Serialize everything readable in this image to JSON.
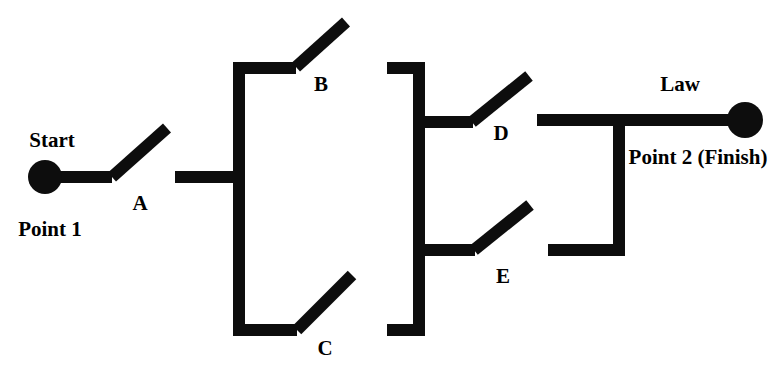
{
  "diagram": {
    "type": "circuit-switch-diagram",
    "width": 782,
    "height": 371,
    "colors": {
      "wire": "#0d0d0d",
      "background": "#ffffff",
      "text": "#000000"
    },
    "stroke_width": 12,
    "terminals": [
      {
        "id": "point1",
        "name": "start-terminal",
        "cx": 45,
        "cy": 177,
        "r": 17,
        "title": "Start",
        "subtitle": "Point 1"
      },
      {
        "id": "point2",
        "name": "finish-terminal",
        "cx": 745,
        "cy": 120,
        "r": 18,
        "title": "Law",
        "subtitle": "Point 2 (Finish)"
      }
    ],
    "switches": [
      {
        "id": "A",
        "label": "A",
        "label_x": 140,
        "label_y": 203,
        "pivot_x": 112,
        "pivot_y": 177,
        "tip_x": 167,
        "tip_y": 128,
        "state": "open"
      },
      {
        "id": "B",
        "label": "B",
        "label_x": 321,
        "label_y": 84,
        "pivot_x": 296,
        "pivot_y": 67,
        "tip_x": 346,
        "tip_y": 22,
        "state": "open"
      },
      {
        "id": "C",
        "label": "C",
        "label_x": 325,
        "label_y": 348,
        "pivot_x": 297,
        "pivot_y": 330,
        "tip_x": 352,
        "tip_y": 275,
        "state": "open"
      },
      {
        "id": "D",
        "label": "D",
        "label_x": 501,
        "label_y": 133,
        "pivot_x": 472,
        "pivot_y": 122,
        "tip_x": 529,
        "tip_y": 76,
        "state": "open"
      },
      {
        "id": "E",
        "label": "E",
        "label_x": 503,
        "label_y": 276,
        "pivot_x": 474,
        "pivot_y": 250,
        "tip_x": 530,
        "tip_y": 205,
        "state": "open"
      }
    ],
    "wires": [
      {
        "id": "w-start-lead",
        "name": "start-lead-wire",
        "points": "45,177 112,177"
      },
      {
        "id": "w-a-to-bus",
        "name": "switch-a-output-wire",
        "points": "175,177 239,177"
      },
      {
        "id": "w-left-bus",
        "name": "left-vertical-bus",
        "points": "239,68 239,330"
      },
      {
        "id": "w-top-left",
        "name": "top-left-branch-wire",
        "points": "233,68 296,68"
      },
      {
        "id": "w-top-right",
        "name": "top-right-branch-wire",
        "points": "387,68 419,68"
      },
      {
        "id": "w-bottom-left",
        "name": "bottom-left-branch-wire",
        "points": "233,330 297,330"
      },
      {
        "id": "w-bottom-right",
        "name": "bottom-right-branch-wire",
        "points": "387,330 419,330"
      },
      {
        "id": "w-right-bus",
        "name": "right-vertical-bus",
        "points": "419,62 419,336"
      },
      {
        "id": "w-d-in",
        "name": "switch-d-input-wire",
        "points": "414,122 473,122"
      },
      {
        "id": "w-e-in",
        "name": "switch-e-input-wire",
        "points": "414,250 475,250"
      },
      {
        "id": "w-d-out",
        "name": "switch-d-output-wire",
        "points": "537,120 619,120"
      },
      {
        "id": "w-e-out",
        "name": "switch-e-output-wire",
        "points": "548,250 619,250"
      },
      {
        "id": "w-join-bus",
        "name": "output-join-bus",
        "points": "619,120 619,256"
      },
      {
        "id": "w-finish-lead",
        "name": "finish-lead-wire",
        "points": "619,120 745,120"
      }
    ],
    "labels": {
      "start_title": "Start",
      "start_subtitle": "Point 1",
      "finish_title": "Law",
      "finish_subtitle": "Point 2 (Finish)",
      "start_title_x": 52,
      "start_title_y": 140,
      "start_subtitle_x": 50,
      "start_subtitle_y": 229,
      "finish_title_x": 680,
      "finish_title_y": 84,
      "finish_subtitle_x": 698,
      "finish_subtitle_y": 157
    }
  }
}
